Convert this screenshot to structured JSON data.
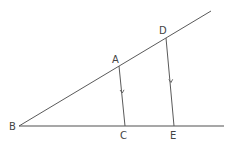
{
  "diagram": {
    "type": "geometry",
    "colors": {
      "line": "#5a5a5a",
      "baseline": "#8a8a8a",
      "label": "#444444",
      "background": "#ffffff"
    },
    "points": {
      "B": {
        "label": "B",
        "x": 19,
        "y": 126
      },
      "A": {
        "label": "A",
        "x": 119,
        "y": 66
      },
      "D": {
        "label": "D",
        "x": 166,
        "y": 38
      },
      "C": {
        "label": "C",
        "x": 125,
        "y": 126
      },
      "E": {
        "label": "E",
        "x": 174,
        "y": 126
      }
    },
    "segments": [
      {
        "name": "ray-BD",
        "from": "B",
        "to_xy": [
          211,
          11
        ]
      },
      {
        "name": "ray-BE",
        "from": "B",
        "to_xy": [
          224,
          126
        ]
      },
      {
        "name": "segment-AC",
        "from": "A",
        "to": "C",
        "parallel_marker": true
      },
      {
        "name": "segment-DE",
        "from": "D",
        "to": "E",
        "parallel_marker": true
      }
    ],
    "labels": {
      "B": "B",
      "A": "A",
      "C": "C",
      "D": "D",
      "E": "E"
    }
  }
}
